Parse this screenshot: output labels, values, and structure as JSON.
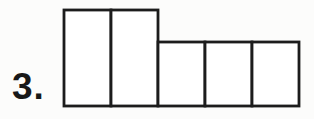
{
  "figure": {
    "label": "3.",
    "stroke_color": "#1c1c1c",
    "fill_color": "#ffffff",
    "stroke_width": 2.8,
    "rectangles": [
      {
        "x": 64,
        "y": 10,
        "width": 47,
        "height": 96
      },
      {
        "x": 111,
        "y": 10,
        "width": 47,
        "height": 96
      },
      {
        "x": 158,
        "y": 42,
        "width": 47,
        "height": 64
      },
      {
        "x": 205,
        "y": 42,
        "width": 47,
        "height": 64
      },
      {
        "x": 252,
        "y": 42,
        "width": 47,
        "height": 64
      }
    ]
  },
  "page": {
    "background": "#fcfcfb",
    "text_color": "#181818"
  }
}
